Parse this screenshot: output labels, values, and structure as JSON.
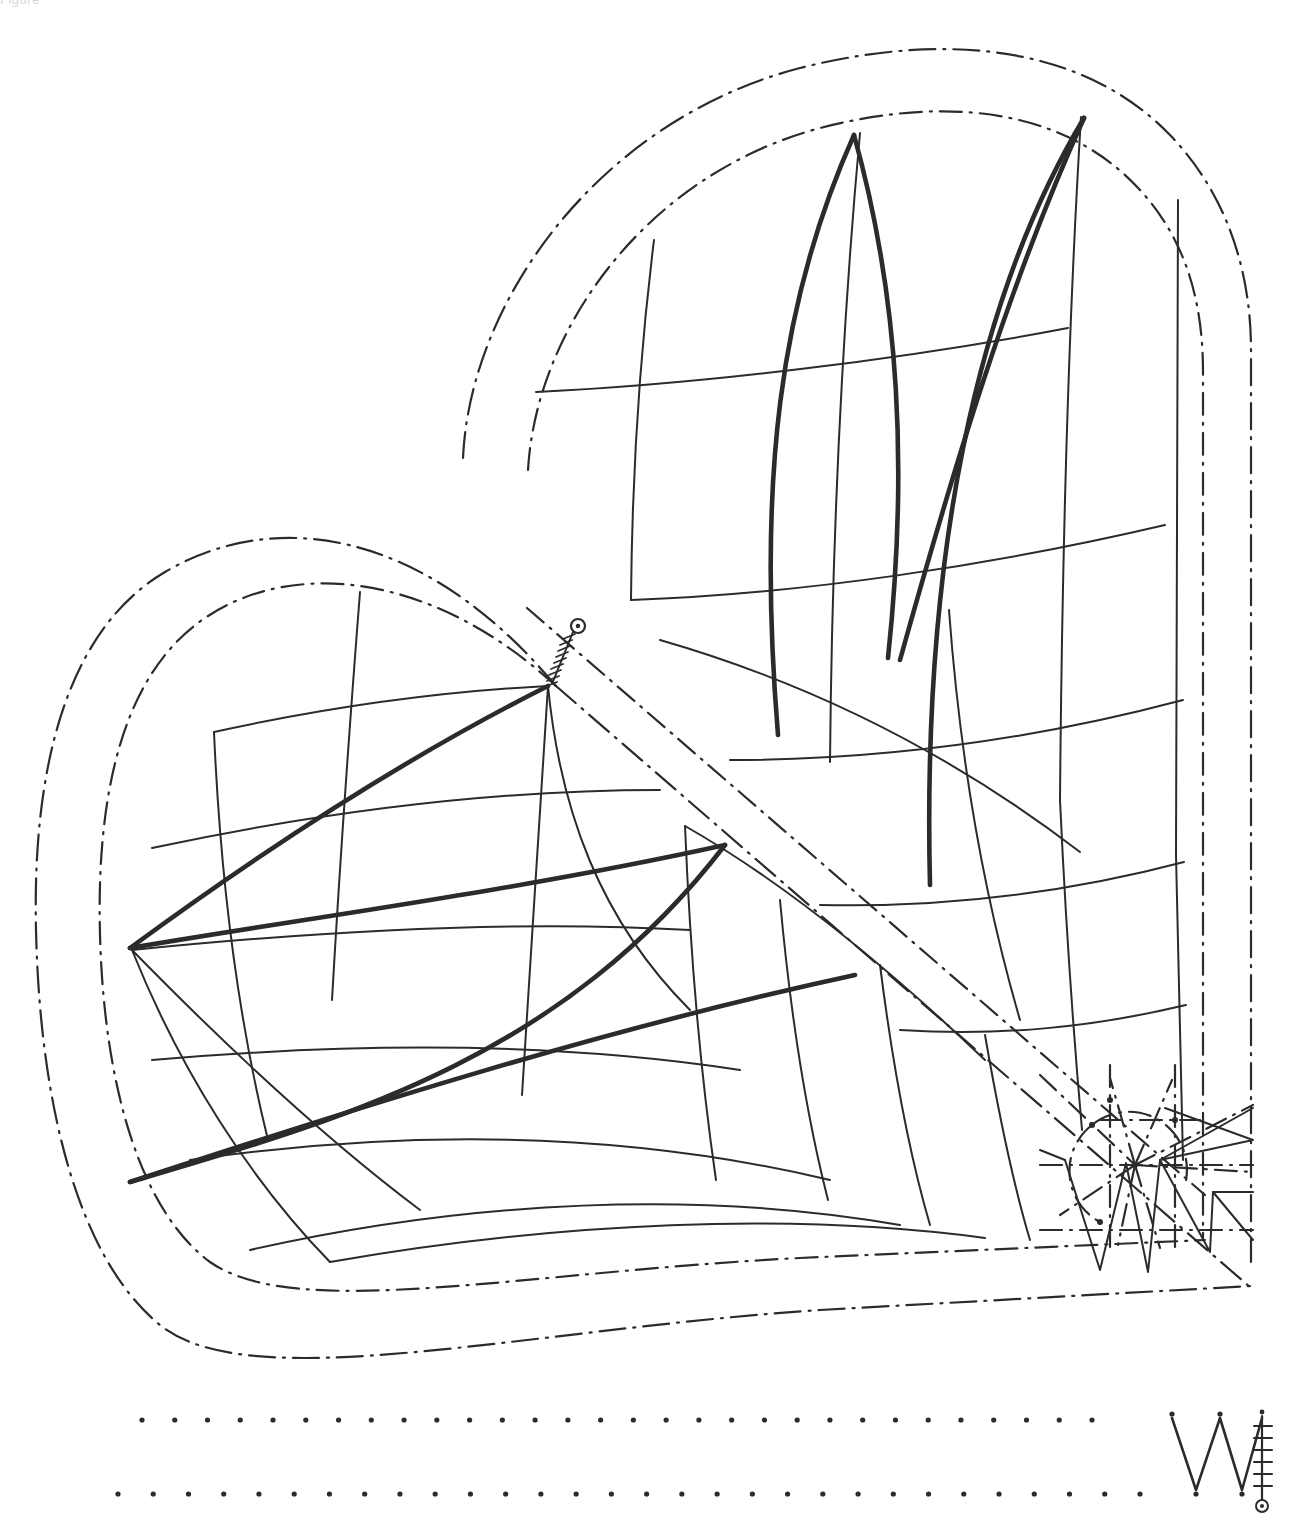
{
  "document": {
    "kind": "technical-line-drawing",
    "background_color": "#ffffff",
    "ink_color": "#2b2b2b",
    "clipped_header_text": "Figure",
    "width": 1304,
    "height": 1526
  },
  "chart_data": {
    "type": "line",
    "title": "",
    "subtitle": "",
    "xlabel": "",
    "ylabel": "",
    "grid": false,
    "legend_position": "none"
  },
  "elements": {
    "left_lobe": {
      "name": "Lower-left mesh lobe",
      "thin_curve_count": 14,
      "thick_curve_count": 4,
      "outer_contour_style": "dash-dot",
      "inner_contour_style": "dash-dot"
    },
    "right_lobe": {
      "name": "Upper-right mesh lobe",
      "thin_curve_count": 13,
      "thick_curve_count": 4,
      "outer_contour_style": "dash-dot",
      "inner_contour_style": "dash-dot"
    },
    "hinge_marker": {
      "name": "Hinge / pivot marker",
      "shape": "small circle with concentric dot and hatched ladder",
      "hatch_count": 9
    },
    "starburst_detail": {
      "name": "Starburst and sawtooth corner detail",
      "ray_count": 12,
      "sawtooth_peaks": 5
    },
    "dot_rows": [
      {
        "name": "upper register dot row",
        "count": 30
      },
      {
        "name": "lower register dot row",
        "count": 30
      }
    ],
    "monogram": {
      "name": "W monogram with scale bar",
      "letter": "W",
      "scale_tick_count": 7,
      "terminal": "circle-with-dot"
    }
  }
}
